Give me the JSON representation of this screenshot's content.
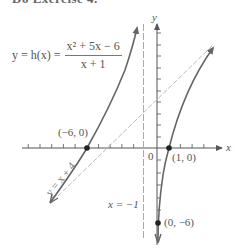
{
  "header": {
    "partial_text": "Do Exercise 4."
  },
  "equation": {
    "lhs": "y = h(x) =",
    "numerator": "x² + 5x − 6",
    "denominator": "x + 1"
  },
  "axes": {
    "x_label": "x",
    "y_label": "y",
    "origin_label": "0"
  },
  "points": [
    {
      "label": "(−6, 0)",
      "x": -6,
      "y": 0
    },
    {
      "label": "(1, 0)",
      "x": 1,
      "y": 0
    },
    {
      "label": "(0, −6)",
      "x": 0,
      "y": -6
    }
  ],
  "asymptotes": {
    "vertical_label": "x = −1",
    "oblique_label": "y = x + 4"
  },
  "colors": {
    "curve": "#666666",
    "asymptote": "#aaaaaa",
    "axis": "#555555",
    "point": "#222222"
  }
}
